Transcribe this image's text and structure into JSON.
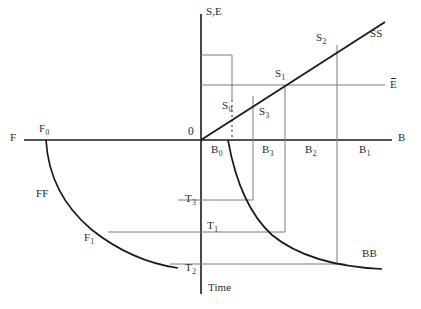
{
  "diagram": {
    "axes": {
      "vertical_up_label": "S,E",
      "horizontal_right_label": "B",
      "horizontal_left_label": "F",
      "vertical_down_label": "Time",
      "origin_label": "0"
    },
    "curves": [
      {
        "name": "SS",
        "label": "SS",
        "type": "line",
        "color": "#1a1a1a"
      },
      {
        "name": "FF",
        "label": "FF",
        "type": "curve",
        "color": "#1a1a1a"
      },
      {
        "name": "BB",
        "label": "BB",
        "type": "curve",
        "color": "#1a1a1a"
      },
      {
        "name": "E-bar",
        "label": "E",
        "type": "horizontal-line",
        "color": "#6e6e6e"
      }
    ],
    "points": {
      "s0": "S",
      "s0_sub": "0",
      "s1": "S",
      "s1_sub": "1",
      "s2": "S",
      "s2_sub": "2",
      "s3": "S",
      "s3_sub": "3",
      "b0": "B",
      "b0_sub": "0",
      "b1": "B",
      "b1_sub": "1",
      "b2": "B",
      "b2_sub": "2",
      "b3": "B",
      "b3_sub": "3",
      "f0": "F",
      "f0_sub": "0",
      "f1": "F",
      "f1_sub": "1",
      "t1": "T",
      "t1_sub": "1",
      "t2": "T",
      "t2_sub": "2",
      "t3": "T",
      "t3_sub": "3"
    },
    "colors": {
      "main_line": "#1a1a1a",
      "grid_line": "#7a7a7a",
      "axis_line": "#1a1a1a",
      "text": "#2b2b2b",
      "background": "#ffffff"
    }
  }
}
